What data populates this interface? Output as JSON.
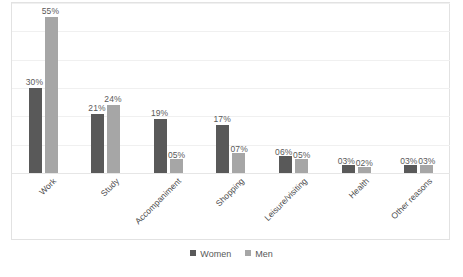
{
  "chart_data": {
    "type": "bar",
    "title": "",
    "xlabel": "",
    "ylabel": "",
    "ylim": [
      0,
      60
    ],
    "grid": true,
    "legend_position": "bottom",
    "gridline_values": [
      60,
      50,
      40,
      30,
      20,
      10,
      0
    ],
    "categories": [
      "Work",
      "Study",
      "Accompaniment",
      "Shopping",
      "Leisure/visiting",
      "Health",
      "Other reasons"
    ],
    "series": [
      {
        "name": "Women",
        "color": "#595959",
        "values": [
          30,
          21,
          19,
          17,
          6,
          3,
          3
        ],
        "labels": [
          "30%",
          "21%",
          "19%",
          "17%",
          "06%",
          "03%",
          "03%"
        ]
      },
      {
        "name": "Men",
        "color": "#a6a6a6",
        "values": [
          55,
          24,
          5,
          7,
          5,
          2,
          3
        ],
        "labels": [
          "55%",
          "24%",
          "05%",
          "07%",
          "05%",
          "02%",
          "03%"
        ]
      }
    ]
  },
  "legend": {
    "items": [
      {
        "label": "Women",
        "color": "#595959"
      },
      {
        "label": "Men",
        "color": "#a6a6a6"
      }
    ]
  }
}
